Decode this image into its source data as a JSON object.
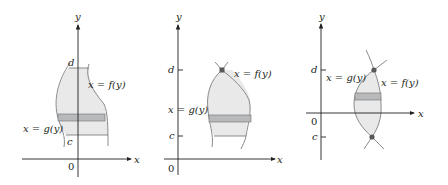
{
  "colors": {
    "region_fill": "#e9e9ea",
    "strip_fill": "#b8b9bb",
    "curve": "#8a8b8d",
    "axis": "#231f20",
    "bound_line": "#6d6e70",
    "point": "#58595b"
  },
  "panels": [
    {
      "id": "panel-1",
      "axis_x": "x",
      "axis_y": "y",
      "origin": "0",
      "lower_bound": "c",
      "upper_bound": "d",
      "right_curve": "x = f(y)",
      "left_curve": "x = g(y)"
    },
    {
      "id": "panel-2",
      "axis_x": "x",
      "axis_y": "y",
      "origin": "0",
      "lower_bound": "c",
      "upper_bound": "d",
      "right_curve": "x = f(y)",
      "left_curve": "x = g(y)"
    },
    {
      "id": "panel-3",
      "axis_x": "x",
      "axis_y": "y",
      "origin": "0",
      "lower_bound": "c",
      "upper_bound": "d",
      "right_curve": "x = f(y)",
      "left_curve": "x = g(y)"
    }
  ]
}
